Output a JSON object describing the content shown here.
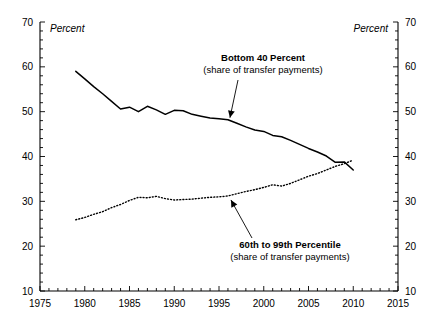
{
  "chart_data": {
    "type": "line",
    "title": "",
    "xlabel": "",
    "ylabel": "Percent",
    "ylabel_right": "Percent",
    "xlim": [
      1975,
      2015
    ],
    "ylim": [
      10,
      70
    ],
    "grid": false,
    "legend_position": "inline-annotations",
    "x_ticks_major": [
      "1975",
      "1980",
      "1985",
      "1990",
      "1995",
      "2000",
      "2005",
      "2010",
      "2015"
    ],
    "x_tick_values": [
      1975,
      1980,
      1985,
      1990,
      1995,
      2000,
      2005,
      2010,
      2015
    ],
    "x_minor_tick_step": 1,
    "y_ticks_major": [
      "10",
      "20",
      "30",
      "40",
      "50",
      "60",
      "70"
    ],
    "y_tick_values": [
      10,
      20,
      30,
      40,
      50,
      60,
      70
    ],
    "y_minor_tick_step": 2,
    "x": [
      1979,
      1980,
      1981,
      1982,
      1983,
      1984,
      1985,
      1986,
      1987,
      1988,
      1989,
      1990,
      1991,
      1992,
      1993,
      1994,
      1995,
      1996,
      1997,
      1998,
      1999,
      2000,
      2001,
      2002,
      2003,
      2004,
      2005,
      2006,
      2007,
      2008,
      2009,
      2010
    ],
    "series": [
      {
        "name": "Bottom 40 Percent",
        "style": "solid",
        "color": "#000000",
        "values": [
          59.0,
          57.3,
          55.6,
          54.0,
          52.3,
          50.6,
          51.0,
          50.0,
          51.2,
          50.4,
          49.4,
          50.3,
          50.2,
          49.4,
          49.0,
          48.6,
          48.4,
          48.2,
          47.4,
          46.6,
          45.9,
          45.6,
          44.7,
          44.4,
          43.6,
          42.7,
          41.8,
          41.0,
          40.1,
          38.7,
          38.8,
          37.0
        ]
      },
      {
        "name": "60th to 99th Percentile",
        "style": "dotted",
        "color": "#000000",
        "values": [
          25.9,
          26.4,
          27.1,
          27.7,
          28.6,
          29.3,
          30.2,
          30.9,
          30.8,
          31.1,
          30.6,
          30.3,
          30.4,
          30.5,
          30.7,
          30.9,
          31.0,
          31.2,
          31.7,
          32.2,
          32.6,
          33.1,
          33.7,
          33.4,
          34.0,
          34.8,
          35.6,
          36.2,
          37.0,
          37.8,
          38.4,
          39.2
        ]
      }
    ],
    "annotations": [
      {
        "id": "bottom40",
        "title": "Bottom 40 Percent",
        "subtitle": "(share of transfer payments)",
        "target_x": 1996,
        "target_y": 48.2
      },
      {
        "id": "p60to99",
        "title": "60th to 99th Percentile",
        "subtitle": "(share of transfer payments)",
        "target_x": 1996,
        "target_y": 31.2
      }
    ]
  }
}
